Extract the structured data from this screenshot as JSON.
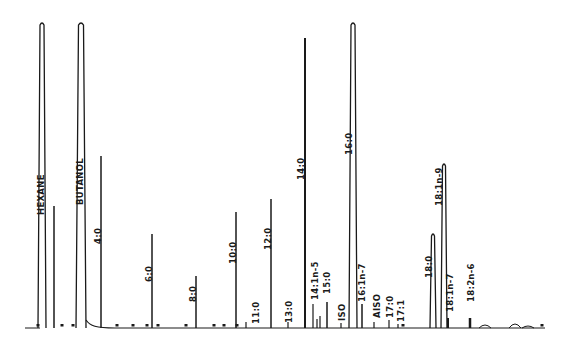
{
  "chart_data": {
    "type": "line",
    "subtype": "gas-chromatogram",
    "title": "",
    "xlabel": "",
    "ylabel": "",
    "grid": false,
    "legend": null,
    "baseline_y": 328,
    "peaks": [
      {
        "label": "HEXANE",
        "x": 42,
        "top": 22,
        "width": 4,
        "label_x": 36,
        "label_y": 215
      },
      {
        "label": "",
        "x": 54,
        "top": 206,
        "width": 1.5
      },
      {
        "label": "BUTANOL",
        "x": 81,
        "top": 22,
        "width": 5,
        "label_x": 75,
        "label_y": 205
      },
      {
        "label": "4:0",
        "x": 101,
        "top": 156,
        "width": 1.5,
        "label_x": 93,
        "label_y": 244
      },
      {
        "label": "6:0",
        "x": 152,
        "top": 234,
        "width": 1.5,
        "label_x": 144,
        "label_y": 282
      },
      {
        "label": "8:0",
        "x": 196,
        "top": 276,
        "width": 1.5,
        "label_x": 188,
        "label_y": 302
      },
      {
        "label": "10:0",
        "x": 236,
        "top": 212,
        "width": 1.5,
        "label_x": 228,
        "label_y": 264
      },
      {
        "label": "11:0",
        "x": 246,
        "top": 322,
        "width": 1.2,
        "label_x": 251,
        "label_y": 324
      },
      {
        "label": "12:0",
        "x": 271,
        "top": 199,
        "width": 1.5,
        "label_x": 263,
        "label_y": 250
      },
      {
        "label": "13:0",
        "x": 288,
        "top": 322,
        "width": 1,
        "label_x": 284,
        "label_y": 323
      },
      {
        "label": "14:0",
        "x": 305,
        "top": 38,
        "width": 2,
        "label_x": 296,
        "label_y": 180
      },
      {
        "label": "14:1n-5",
        "x": 313,
        "top": 304,
        "width": 1.2,
        "label_x": 310,
        "label_y": 300
      },
      {
        "label": "",
        "x": 317,
        "top": 319,
        "width": 1.2
      },
      {
        "label": "",
        "x": 320,
        "top": 316,
        "width": 1.2
      },
      {
        "label": "15:0",
        "x": 327,
        "top": 302,
        "width": 1.5,
        "label_x": 322,
        "label_y": 294
      },
      {
        "label": "ISO",
        "x": 341,
        "top": 323,
        "width": 1,
        "label_x": 337,
        "label_y": 321
      },
      {
        "label": "16:0",
        "x": 353,
        "top": 22,
        "width": 4,
        "label_x": 344,
        "label_y": 155
      },
      {
        "label": "16:1n-7",
        "x": 362,
        "top": 304,
        "width": 1.5,
        "label_x": 357,
        "label_y": 302
      },
      {
        "label": "AISO",
        "x": 374,
        "top": 322,
        "width": 1,
        "label_x": 372,
        "label_y": 318
      },
      {
        "label": "17:0",
        "x": 389,
        "top": 320,
        "width": 1.2,
        "label_x": 385,
        "label_y": 318
      },
      {
        "label": "17:1",
        "x": 398,
        "top": 324,
        "width": 1,
        "label_x": 396,
        "label_y": 322
      },
      {
        "label": "18:0",
        "x": 433,
        "top": 233,
        "width": 3,
        "label_x": 424,
        "label_y": 278
      },
      {
        "label": "18:1n-9",
        "x": 444,
        "top": 163,
        "width": 3,
        "label_x": 434,
        "label_y": 206
      },
      {
        "label": "18:1n-7",
        "x": 448,
        "top": 318,
        "width": 2,
        "label_x": 445,
        "label_y": 312
      },
      {
        "label": "18:2n-6",
        "x": 470,
        "top": 318,
        "width": 2.5,
        "label_x": 466,
        "label_y": 302
      }
    ],
    "markers_x": [
      38,
      62,
      73,
      117,
      133,
      147,
      158,
      186,
      214,
      224,
      237,
      403,
      542
    ]
  }
}
